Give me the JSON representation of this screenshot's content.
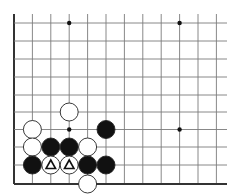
{
  "diagram": {
    "type": "go-board-corner",
    "colors": {
      "background": "#ffffff",
      "grid": "#7a7a7a",
      "edge": "#333333",
      "black_stone": "#111111",
      "white_stone": "#ffffff",
      "stone_outline": "#222222",
      "star_point": "#111111",
      "marker": "#111111"
    },
    "grid": {
      "x_lines": [
        14,
        32.4,
        50.8,
        69.2,
        87.6,
        106,
        124.4,
        142.8,
        161.2,
        179.6,
        198,
        216.4
      ],
      "y_lines": [
        23,
        41,
        59,
        77,
        95,
        112,
        129.5,
        147,
        165,
        184
      ],
      "left_edge_x": 14,
      "bottom_edge_y": 184,
      "top_extend_y": 14,
      "right_extend_x": 227
    },
    "star_points": [
      {
        "col": 3,
        "row": 0
      },
      {
        "col": 9,
        "row": 0
      },
      {
        "col": 3,
        "row": 6
      },
      {
        "col": 9,
        "row": 6
      }
    ],
    "stones": [
      {
        "color": "white",
        "col": 3,
        "row": 5,
        "marker": ""
      },
      {
        "color": "white",
        "col": 1,
        "row": 6,
        "marker": ""
      },
      {
        "color": "black",
        "col": 5,
        "row": 6,
        "marker": ""
      },
      {
        "color": "white",
        "col": 1,
        "row": 7,
        "marker": ""
      },
      {
        "color": "black",
        "col": 2,
        "row": 7,
        "marker": ""
      },
      {
        "color": "black",
        "col": 3,
        "row": 7,
        "marker": ""
      },
      {
        "color": "white",
        "col": 4,
        "row": 7,
        "marker": ""
      },
      {
        "color": "black",
        "col": 1,
        "row": 8,
        "marker": ""
      },
      {
        "color": "white",
        "col": 2,
        "row": 8,
        "marker": "triangle"
      },
      {
        "color": "white",
        "col": 3,
        "row": 8,
        "marker": "triangle"
      },
      {
        "color": "black",
        "col": 4,
        "row": 8,
        "marker": ""
      },
      {
        "color": "black",
        "col": 5,
        "row": 8,
        "marker": ""
      },
      {
        "color": "white",
        "col": 4,
        "row": 9,
        "marker": ""
      }
    ],
    "stone_radius": 9
  }
}
